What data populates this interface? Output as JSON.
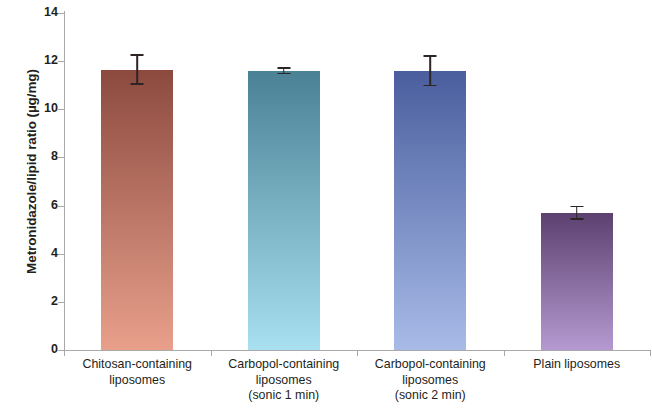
{
  "chart_data": {
    "type": "bar",
    "title": "",
    "xlabel": "",
    "ylabel": "Metronidazole/lipid ratio (µg/mg)",
    "ylim": [
      0,
      14
    ],
    "ytick_labels": [
      "0",
      "2",
      "4",
      "6",
      "8",
      "10",
      "12",
      "14"
    ],
    "ytick_values": [
      0,
      2,
      4,
      6,
      8,
      10,
      12,
      14
    ],
    "grid": false,
    "legend": null,
    "categories": [
      "Chitosan-containing liposomes",
      "Carbopol-containing liposomes (sonic 1 min)",
      "Carbopol-containing liposomes (sonic 2 min)",
      "Plain liposomes"
    ],
    "category_lines": [
      [
        "Chitosan-containing",
        "liposomes"
      ],
      [
        "Carbopol-containing",
        "liposomes",
        "(sonic 1 min)"
      ],
      [
        "Carbopol-containing",
        "liposomes",
        "(sonic 2 min)"
      ],
      [
        "Plain liposomes"
      ]
    ],
    "values": [
      11.65,
      11.6,
      11.6,
      5.7
    ],
    "errors": [
      0.65,
      0.15,
      0.65,
      0.3
    ],
    "bar_colors_top": [
      "#8c4a3f",
      "#4a8195",
      "#4a5e9e",
      "#5c4070"
    ],
    "bar_colors_bottom": [
      "#e8a08b",
      "#a9e0f0",
      "#a8bbe8",
      "#b49ad0"
    ],
    "error_bar_color": "#2d2424",
    "axis_color": "#a9a9a9",
    "text_color": "#231f20",
    "background_color": "#ffffff"
  }
}
